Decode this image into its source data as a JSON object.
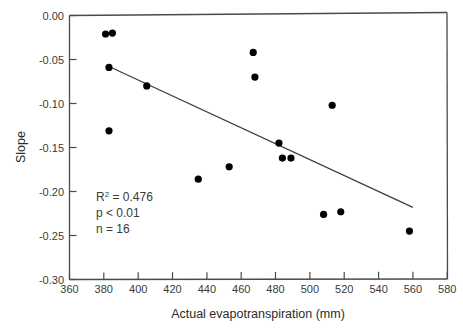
{
  "chart_data": {
    "type": "scatter",
    "title": "",
    "xlabel": "Actual evapotranspiration (mm)",
    "ylabel": "Slope",
    "xlim": [
      360,
      580
    ],
    "ylim": [
      -0.3,
      0.0
    ],
    "xticks": [
      360,
      380,
      400,
      420,
      440,
      460,
      480,
      500,
      520,
      540,
      560,
      580
    ],
    "yticks": [
      "0.00",
      "-0.05",
      "-0.10",
      "-0.15",
      "-0.20",
      "-0.25",
      "-0.30"
    ],
    "grid": false,
    "legend": null,
    "marker": "filled-circle",
    "marker_color": "#000000",
    "points": [
      {
        "x": 381,
        "y": -0.021
      },
      {
        "x": 385,
        "y": -0.02
      },
      {
        "x": 383,
        "y": -0.059
      },
      {
        "x": 383,
        "y": -0.131
      },
      {
        "x": 405,
        "y": -0.08
      },
      {
        "x": 435,
        "y": -0.186
      },
      {
        "x": 453,
        "y": -0.172
      },
      {
        "x": 467,
        "y": -0.042
      },
      {
        "x": 468,
        "y": -0.07
      },
      {
        "x": 482,
        "y": -0.145
      },
      {
        "x": 484,
        "y": -0.162
      },
      {
        "x": 489,
        "y": -0.162
      },
      {
        "x": 508,
        "y": -0.226
      },
      {
        "x": 513,
        "y": -0.102
      },
      {
        "x": 518,
        "y": -0.223
      },
      {
        "x": 558,
        "y": -0.245
      }
    ],
    "trendline": {
      "x_start": 383,
      "y_start": -0.058,
      "x_end": 560,
      "y_end": -0.218,
      "color": "#3c3c3c"
    },
    "annotations": {
      "r2_prefix": "R",
      "r2_sup": "2",
      "r2_value": " = 0.476",
      "pvalue": "p < 0.01",
      "n": "n = 16"
    }
  }
}
